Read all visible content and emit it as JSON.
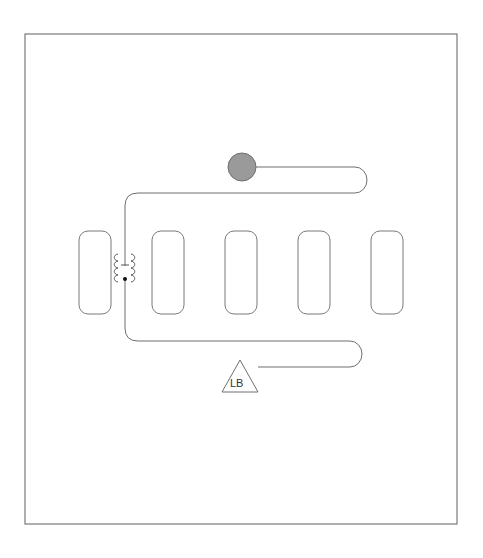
{
  "diagram": {
    "title": "",
    "start_marker": {
      "shape": "circle",
      "color": "#9a9a9a"
    },
    "end_marker": {
      "shape": "triangle",
      "label": "LB"
    },
    "blocks": [
      {
        "id": "block-1"
      },
      {
        "id": "block-2"
      },
      {
        "id": "block-3"
      },
      {
        "id": "block-4"
      },
      {
        "id": "block-5"
      }
    ],
    "component": {
      "type": "transformer-coil",
      "coils": 2
    },
    "colors": {
      "stroke": "#6e6e6e",
      "fill_marker": "#9a9a9a",
      "background": "#ffffff"
    }
  }
}
